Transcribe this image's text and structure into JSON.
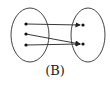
{
  "diagram": {
    "type": "mapping-diagram",
    "caption": "(B)",
    "sets": [
      {
        "name": "domain",
        "cx": 30,
        "cy": 35,
        "rx": 19,
        "ry": 27,
        "points": [
          {
            "x": 26,
            "y": 24
          },
          {
            "x": 26,
            "y": 34
          },
          {
            "x": 26,
            "y": 45
          }
        ]
      },
      {
        "name": "codomain",
        "cx": 88,
        "cy": 35,
        "rx": 17,
        "ry": 27,
        "points": [
          {
            "x": 83,
            "y": 25
          },
          {
            "x": 83,
            "y": 44
          }
        ]
      }
    ],
    "mappings": [
      {
        "from": 0,
        "to": 0
      },
      {
        "from": 1,
        "to": 1
      },
      {
        "from": 2,
        "to": 1
      }
    ],
    "colors": {
      "stroke": "#222222",
      "background": "#ffffff"
    }
  }
}
